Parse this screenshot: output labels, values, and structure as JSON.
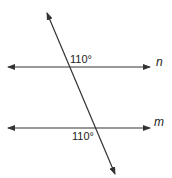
{
  "diagram": {
    "type": "parallel-lines-with-transversal",
    "stroke_color": "#333333",
    "lines": [
      {
        "name": "n",
        "label": "n",
        "kind": "parallel",
        "y": 67,
        "x1": 8,
        "x2": 150,
        "arrows": "both"
      },
      {
        "name": "m",
        "label": "m",
        "kind": "parallel",
        "y": 128,
        "x1": 8,
        "x2": 150,
        "arrows": "both"
      },
      {
        "name": "transversal",
        "label": "",
        "kind": "transversal",
        "x1": 47,
        "y1": 13,
        "x2": 115,
        "y2": 174,
        "arrows": "both"
      }
    ],
    "angles": [
      {
        "label": "110°",
        "at_line": "n",
        "position": "above-right of intersection"
      },
      {
        "label": "110°",
        "at_line": "m",
        "position": "below-left of intersection"
      }
    ]
  }
}
